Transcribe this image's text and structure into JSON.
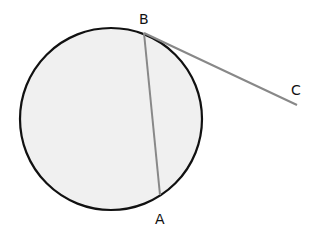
{
  "diagram": {
    "type": "geometry-circle-chord-tangent",
    "circle": {
      "cx": 111,
      "cy": 119,
      "r": 91,
      "fill": "#f0f0f0",
      "stroke": "#111111"
    },
    "points": {
      "A": {
        "label": "A",
        "x": 160,
        "y": 195
      },
      "B": {
        "label": "B",
        "x": 144,
        "y": 33
      },
      "C": {
        "label": "C",
        "x": 297,
        "y": 105
      }
    },
    "segments": [
      {
        "from": "B",
        "to": "A",
        "color": "#888888"
      },
      {
        "from": "B",
        "to": "C",
        "color": "#888888"
      }
    ]
  }
}
